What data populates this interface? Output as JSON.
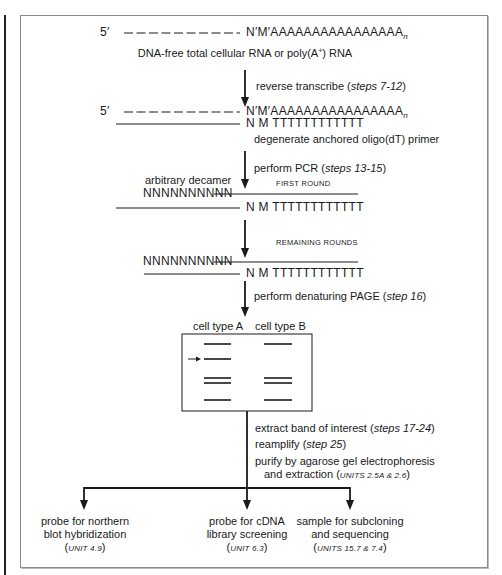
{
  "diagram": {
    "stage1": {
      "prime": "5′",
      "sequence": "N′M′AAAAAAAAAAAAAAAA",
      "subscript": "n",
      "caption_pre": "DNA-free total cellular RNA or poly(A",
      "caption_sup": "+",
      "caption_post": ") RNA"
    },
    "step_rt": {
      "text": "reverse transcribe (",
      "ref": "steps 7-12",
      "close": ")"
    },
    "stage2": {
      "prime": "5′",
      "sequence": "N′M′AAAAAAAAAAAAAAAA",
      "subscript": "n",
      "primer_seq": "N M TTTTTTTTTTTT",
      "primer_label": "degenerate anchored oligo(dT) primer"
    },
    "step_pcr": {
      "text": "perform PCR (",
      "ref": "steps 13-15",
      "close": ")"
    },
    "first_round_label": "FIRST ROUND",
    "stage3": {
      "decamer_label": "arbitrary decamer",
      "decamer_seq": "NNNNNNNNNN",
      "primer_seq": "N M TTTTTTTTTTTT"
    },
    "remaining_rounds_label": "REMAINING ROUNDS",
    "stage4": {
      "decamer_seq": "NNNNNNNNNN",
      "primer_seq": "N M TTTTTTTTTTTT"
    },
    "step_page": {
      "text": "perform denaturing PAGE (",
      "ref": "step 16",
      "close": ")"
    },
    "gel": {
      "lane_a_label": "cell type A",
      "lane_b_label": "cell type B",
      "lane_a_bands": [
        1,
        2,
        3,
        3.5,
        4
      ],
      "lane_b_bands": [
        1,
        3,
        3.5,
        4
      ],
      "marked_band": "lane A band 2"
    },
    "steps_after_gel": [
      {
        "text": "extract band of interest (",
        "ref": "steps 17-24",
        "close": ")"
      },
      {
        "text": "reamplify (",
        "ref": "step 25",
        "close": ")"
      },
      {
        "text": "purify by agarose gel electrophoresis",
        "ref": "",
        "close": ""
      },
      {
        "text": "and extraction (",
        "ref": "UNITS 2.5A & 2.6",
        "close": ")"
      }
    ],
    "outcomes": [
      {
        "line1": "probe for northern",
        "line2": "blot hybridization",
        "ref": "UNIT 4.9"
      },
      {
        "line1": "probe for cDNA",
        "line2": "library screening",
        "ref": "UNIT 6.3"
      },
      {
        "line1": "sample for subcloning",
        "line2": "and sequencing",
        "ref": "UNITS 15.7 & 7.4"
      }
    ],
    "colors": {
      "line": "#1a1a1a",
      "frame": "#8a8a8a",
      "background": "#ffffff"
    }
  }
}
